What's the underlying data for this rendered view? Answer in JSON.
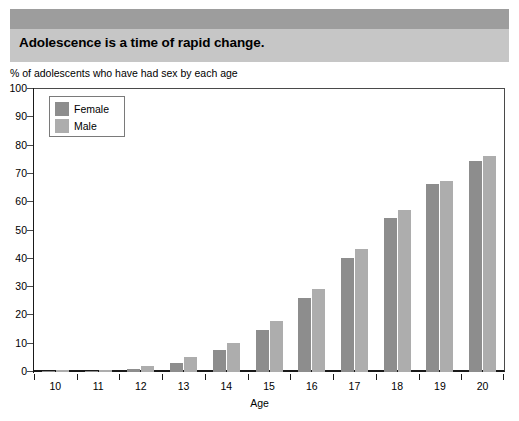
{
  "banner": {
    "title": "Adolescence is a time of rapid change."
  },
  "axis_note": "% of adolescents who have had sex by each age",
  "legend": {
    "items": [
      {
        "label": "Female",
        "color": "#8d8d8d"
      },
      {
        "label": "Male",
        "color": "#adadad"
      }
    ]
  },
  "colors": {
    "banner_strip": "#9d9d9d",
    "banner_band": "#c6c6c6",
    "female_bar": "#8d8d8d",
    "male_bar": "#adadad",
    "axis": "#1a1a1a"
  },
  "chart_data": {
    "type": "bar",
    "title": "Adolescence is a time of rapid change.",
    "subtitle": "% of adolescents who have had sex by each age",
    "xlabel": "Age",
    "ylabel": "",
    "categories": [
      "10",
      "11",
      "12",
      "13",
      "14",
      "15",
      "16",
      "17",
      "18",
      "19",
      "20"
    ],
    "series": [
      {
        "name": "Female",
        "color": "#8d8d8d",
        "values": [
          0.4,
          0.5,
          1.1,
          3.1,
          7.9,
          14.8,
          26.1,
          40.4,
          54.3,
          66.4,
          74.5
        ]
      },
      {
        "name": "Male",
        "color": "#adadad",
        "values": [
          0.6,
          0.8,
          2.2,
          5.4,
          10.4,
          18.2,
          29.3,
          43.3,
          57.3,
          67.5,
          76.4
        ]
      }
    ],
    "ylim": [
      0,
      100
    ],
    "yticks": [
      0,
      10,
      20,
      30,
      40,
      50,
      60,
      70,
      80,
      90,
      100
    ],
    "grid": false,
    "legend_position": "top-left"
  }
}
